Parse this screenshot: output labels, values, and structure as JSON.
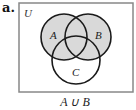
{
  "part_label": "a.",
  "universe_label": "U",
  "sets": [
    {
      "name": "A",
      "cx": 64,
      "cy": 37,
      "r": 23
    },
    {
      "name": "B",
      "cx": 88,
      "cy": 37,
      "r": 23
    },
    {
      "name": "C",
      "cx": 76,
      "cy": 60,
      "r": 24
    }
  ],
  "shaded_region": "A ∪ B",
  "caption": "A ∪ B",
  "colors": {
    "shade": "#d9d9d9",
    "stroke": "#1a1a1a",
    "frame": "#888888"
  }
}
